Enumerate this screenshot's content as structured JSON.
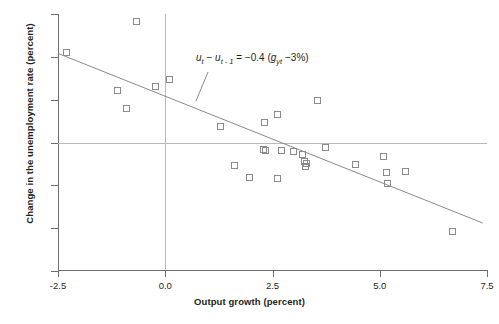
{
  "chart_data": {
    "type": "scatter",
    "title": "",
    "xlabel": "Output growth (percent)",
    "ylabel": "Change in the unemployment rate (percent)",
    "xlim": [
      -2.5,
      7.5
    ],
    "ylim": [
      -3,
      3
    ],
    "xticks": [
      "-2.5",
      "0.0",
      "2.5",
      "5.0",
      "7.5"
    ],
    "xtick_values": [
      -2.5,
      0.0,
      2.5,
      5.0,
      7.5
    ],
    "yticks": [
      "3",
      "2",
      "1",
      "0",
      "-1",
      "-2",
      "-3"
    ],
    "ytick_values": [
      3,
      2,
      1,
      0,
      -1,
      -2,
      -3
    ],
    "grid": false,
    "legend": null,
    "zero_lines": {
      "horizontal": 0,
      "vertical": 0
    },
    "annotation": {
      "text": "u_t - u_(t-1) = -0.4 (g_yt - 3%)",
      "lhs_var": "u",
      "lhs_sub": "t",
      "lhs_var2": "u",
      "lhs_sub2": "t - 1",
      "slope": "-0.4",
      "growth_var": "g",
      "growth_sub": "yt",
      "normal_growth": "3%"
    },
    "fit_line": {
      "type": "line",
      "slope": -0.4,
      "intercept": 1.08,
      "x_start": -2.5,
      "y_start": 2.08,
      "x_end": 7.4,
      "y_end": -1.88
    },
    "points": [
      {
        "x": -2.28,
        "y": 2.08
      },
      {
        "x": -0.65,
        "y": 2.82
      },
      {
        "x": -1.1,
        "y": 1.2
      },
      {
        "x": -0.88,
        "y": 0.78
      },
      {
        "x": -0.22,
        "y": 1.29
      },
      {
        "x": 0.1,
        "y": 1.47
      },
      {
        "x": 1.3,
        "y": 0.36
      },
      {
        "x": 2.32,
        "y": 0.45
      },
      {
        "x": 2.62,
        "y": 0.65
      },
      {
        "x": 3.55,
        "y": 0.97
      },
      {
        "x": 2.3,
        "y": -0.18
      },
      {
        "x": 2.35,
        "y": -0.2
      },
      {
        "x": 2.72,
        "y": -0.2
      },
      {
        "x": 3.0,
        "y": -0.22
      },
      {
        "x": 3.22,
        "y": -0.3
      },
      {
        "x": 3.25,
        "y": -0.46
      },
      {
        "x": 3.28,
        "y": -0.58
      },
      {
        "x": 3.75,
        "y": -0.14
      },
      {
        "x": 1.62,
        "y": -0.55
      },
      {
        "x": 1.98,
        "y": -0.82
      },
      {
        "x": 2.62,
        "y": -0.86
      },
      {
        "x": 3.3,
        "y": -0.5
      },
      {
        "x": 4.45,
        "y": -0.52
      },
      {
        "x": 5.1,
        "y": -0.35
      },
      {
        "x": 5.18,
        "y": -0.72
      },
      {
        "x": 5.2,
        "y": -0.97
      },
      {
        "x": 5.62,
        "y": -0.7
      },
      {
        "x": 6.7,
        "y": -2.08
      }
    ]
  }
}
